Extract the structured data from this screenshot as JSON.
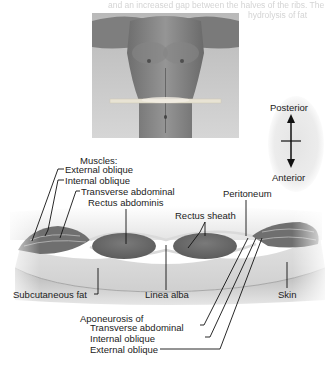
{
  "header": {
    "faded_caption_line1": "and an increased gap between the halves of the ribs. The",
    "faded_caption_line2": "hydrolysis of fat"
  },
  "photo": {
    "description": "male torso with horizontal transparent cross-section plane at waist level"
  },
  "orientation": {
    "top_label": "Posterior",
    "bottom_label": "Anterior",
    "arrow_icon": "up-down-arrow"
  },
  "labels": {
    "muscles_heading": "Muscles:",
    "external_oblique": "External oblique",
    "internal_oblique": "Internal oblique",
    "transverse_abdominal": "Transverse abdominal",
    "rectus_abdominis": "Rectus abdominis",
    "rectus_sheath": "Rectus sheath",
    "peritoneum": "Peritoneum",
    "subcutaneous_fat": "Subcutaneous fat",
    "linea_alba": "Linea alba",
    "skin": "Skin",
    "aponeurosis_heading": "Aponeurosis of",
    "apo_transverse_abdominal": "Transverse abdominal",
    "apo_internal_oblique": "Internal oblique",
    "apo_external_oblique": "External oblique"
  },
  "colors": {
    "muscle": "#8a8a8a",
    "fat": "#d8d8d8",
    "skin": "#bdbdbd",
    "line": "#222222"
  }
}
